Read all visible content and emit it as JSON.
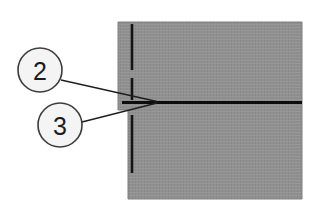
{
  "figure": {
    "type": "technical-cross-section-diagram",
    "background_color": "#ffffff",
    "specimen": {
      "name": "hatched-specimen-block",
      "fill_color": "#8f8f8f",
      "edge_color": "#7c7c7c",
      "x": 118,
      "y": 22,
      "width": 184,
      "height": 177,
      "notch": {
        "name": "left-edge-step",
        "x": 118,
        "y": 110,
        "width": 10,
        "height": 89
      }
    },
    "centerline": {
      "name": "vertical-dash-dot-axis",
      "color": "#141414",
      "x": 132,
      "y_top": 24,
      "y_bottom": 197,
      "style": "dash-dot",
      "stroke_width": 2.6
    },
    "crack": {
      "name": "horizontal-crack-line",
      "color": "#0d0d0d",
      "y": 102,
      "x_start": 122,
      "x_end": 302,
      "stroke_width": 3.2
    },
    "callouts": [
      {
        "id": "callout-2",
        "label": "2",
        "circle": {
          "cx": 40,
          "cy": 70,
          "r": 22
        },
        "circle_fill": "#f4f4f4",
        "circle_stroke": "#3c3c3c",
        "leader": {
          "x1": 61,
          "y1": 80,
          "x2": 157,
          "y2": 102
        }
      },
      {
        "id": "callout-3",
        "label": "3",
        "circle": {
          "cx": 60,
          "cy": 125,
          "r": 22
        },
        "circle_fill": "#f4f4f4",
        "circle_stroke": "#3c3c3c",
        "leader": {
          "x1": 82,
          "y1": 122,
          "x2": 157,
          "y2": 103
        }
      }
    ]
  }
}
